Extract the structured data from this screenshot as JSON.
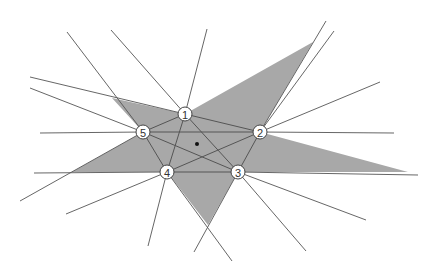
{
  "diagram": {
    "title": "",
    "colors": {
      "background": "#ffffff",
      "star_fill": "#a8a8a8",
      "line": "#555555",
      "node_fill": "#ffffff",
      "node_stroke": "#444444",
      "center_dot": "#111111"
    },
    "star_polygon": [
      [
        112,
        98
      ],
      [
        185,
        114
      ],
      [
        313,
        42
      ],
      [
        260,
        132
      ],
      [
        408,
        172
      ],
      [
        238,
        172
      ],
      [
        208,
        225
      ],
      [
        167,
        172
      ],
      [
        72,
        172
      ],
      [
        143,
        132
      ]
    ],
    "nodes": [
      {
        "id": "1",
        "label": "1",
        "x": 185,
        "y": 114
      },
      {
        "id": "2",
        "label": "2",
        "x": 260,
        "y": 132
      },
      {
        "id": "3",
        "label": "3",
        "x": 238,
        "y": 172
      },
      {
        "id": "4",
        "label": "4",
        "x": 167,
        "y": 172
      },
      {
        "id": "5",
        "label": "5",
        "x": 143,
        "y": 132
      }
    ],
    "center_point": {
      "x": 197,
      "y": 144
    },
    "inner_edges": [
      [
        "1",
        "2"
      ],
      [
        "2",
        "3"
      ],
      [
        "3",
        "4"
      ],
      [
        "4",
        "5"
      ],
      [
        "5",
        "1"
      ],
      [
        "1",
        "3"
      ],
      [
        "1",
        "4"
      ],
      [
        "2",
        "4"
      ],
      [
        "2",
        "5"
      ],
      [
        "3",
        "5"
      ]
    ],
    "rays": [
      {
        "from": "1",
        "to": [
          111,
          30
        ]
      },
      {
        "from": "1",
        "to": [
          207,
          29
        ]
      },
      {
        "from": "5",
        "to": [
          67,
          32
        ]
      },
      {
        "from": "5",
        "to": [
          30,
          88
        ]
      },
      {
        "from": "5",
        "to": [
          40,
          133
        ]
      },
      {
        "from": "1",
        "to": [
          30,
          77
        ]
      },
      {
        "from": "2",
        "to": [
          326,
          21
        ]
      },
      {
        "from": "2",
        "to": [
          334,
          31
        ]
      },
      {
        "from": "2",
        "to": [
          380,
          82
        ]
      },
      {
        "from": "2",
        "to": [
          394,
          133
        ]
      },
      {
        "from": "3",
        "to": [
          418,
          175
        ]
      },
      {
        "from": "3",
        "to": [
          366,
          220
        ]
      },
      {
        "from": "3",
        "to": [
          306,
          251
        ]
      },
      {
        "from": "3",
        "to": [
          194,
          252
        ]
      },
      {
        "from": "4",
        "to": [
          232,
          261
        ]
      },
      {
        "from": "4",
        "to": [
          148,
          246
        ]
      },
      {
        "from": "4",
        "to": [
          66,
          214
        ]
      },
      {
        "from": "4",
        "to": [
          34,
          173
        ]
      },
      {
        "from": "5",
        "to": [
          20,
          201
        ]
      }
    ]
  }
}
